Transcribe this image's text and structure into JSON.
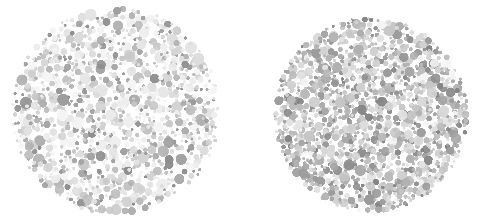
{
  "page": {
    "width": 489,
    "height": 220,
    "background_color": "#ffffff"
  },
  "plates": [
    {
      "name": "ishihara-plate-left",
      "label": "Left plate",
      "center_x": 116,
      "center_y": 111,
      "radius": 106,
      "dot_count": 1150,
      "dot_radius_min": 1.4,
      "dot_radius_max": 6.2,
      "blur_px": 0.55,
      "seed": 20250411,
      "palette": [
        "#ededed",
        "#e4e4e4",
        "#dcdcdc",
        "#d2d2d2",
        "#c8c8c8",
        "#bdbdbd",
        "#b0b0b0",
        "#a2a2a2",
        "#979797",
        "#8d8d8d"
      ],
      "palette_weights": [
        14,
        15,
        14,
        12,
        11,
        9,
        8,
        7,
        6,
        4
      ],
      "tone_bias": 0.0,
      "gap_chance": 0.11
    },
    {
      "name": "ishihara-plate-right",
      "label": "Right plate",
      "center_x": 371,
      "center_y": 115,
      "radius": 99,
      "dot_count": 1320,
      "dot_radius_min": 1.5,
      "dot_radius_max": 5.8,
      "blur_px": 0.5,
      "seed": 77310925,
      "palette": [
        "#e2e2e2",
        "#d9d9d9",
        "#d0d0d0",
        "#c6c6c6",
        "#bbbbbb",
        "#b1b1b1",
        "#a6a6a6",
        "#9b9b9b",
        "#909090",
        "#858585"
      ],
      "palette_weights": [
        10,
        12,
        13,
        13,
        12,
        11,
        10,
        8,
        7,
        4
      ],
      "tone_bias": 0.14,
      "gap_chance": 0.05
    }
  ]
}
